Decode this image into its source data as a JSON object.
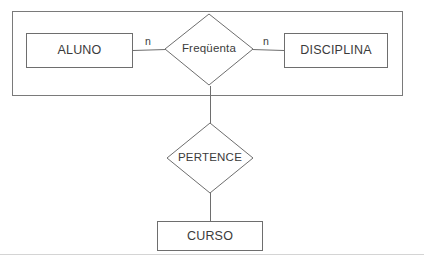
{
  "diagram": {
    "type": "er-diagram",
    "canvas": {
      "width": 424,
      "height": 264,
      "background": "#ffffff"
    },
    "style": {
      "stroke": "#6e6e6e",
      "stroke_light": "#9a9a9a",
      "text_color": "#3b3b3b",
      "fill": "#ffffff",
      "stroke_width": 1
    },
    "grouping_box": {
      "name": "outer-grouping-box",
      "x": 12,
      "y": 11,
      "width": 391,
      "height": 85
    },
    "entities": [
      {
        "id": "aluno",
        "label": "ALUNO",
        "x": 26,
        "y": 33,
        "width": 107,
        "height": 35
      },
      {
        "id": "disciplina",
        "label": "DISCIPLINA",
        "x": 284,
        "y": 33,
        "width": 104,
        "height": 35
      },
      {
        "id": "curso",
        "label": "CURSO",
        "x": 157,
        "y": 221,
        "width": 106,
        "height": 30
      }
    ],
    "relationships": [
      {
        "id": "frequenta",
        "label": "Freqüenta",
        "cx": 209,
        "cy": 49,
        "rx": 44,
        "ry": 36
      },
      {
        "id": "pertence",
        "label": "PERTENCE",
        "cx": 210,
        "cy": 158,
        "rx": 43,
        "ry": 35
      }
    ],
    "connectors": [
      {
        "id": "aluno-frequenta",
        "from": "aluno",
        "to": "frequenta",
        "x1": 133,
        "y1": 50,
        "x2": 165,
        "y2": 49,
        "cardinality": "n",
        "cardinality_x": 148,
        "cardinality_y": 37
      },
      {
        "id": "frequenta-disciplina",
        "from": "frequenta",
        "to": "disciplina",
        "x1": 253,
        "y1": 49,
        "x2": 284,
        "y2": 50,
        "cardinality": "n",
        "cardinality_x": 266,
        "cardinality_y": 37
      },
      {
        "id": "frequenta-pertence",
        "from": "frequenta",
        "to": "pertence",
        "x1": 210,
        "y1": 90,
        "x2": 210,
        "y2": 123,
        "cardinality": "",
        "cardinality_x": 0,
        "cardinality_y": 0
      },
      {
        "id": "pertence-curso",
        "from": "pertence",
        "to": "curso",
        "x1": 210,
        "y1": 193,
        "x2": 210,
        "y2": 221,
        "cardinality": "",
        "cardinality_x": 0,
        "cardinality_y": 0
      }
    ],
    "footer_rule": {
      "name": "page-bottom-rule",
      "y": 254
    }
  }
}
